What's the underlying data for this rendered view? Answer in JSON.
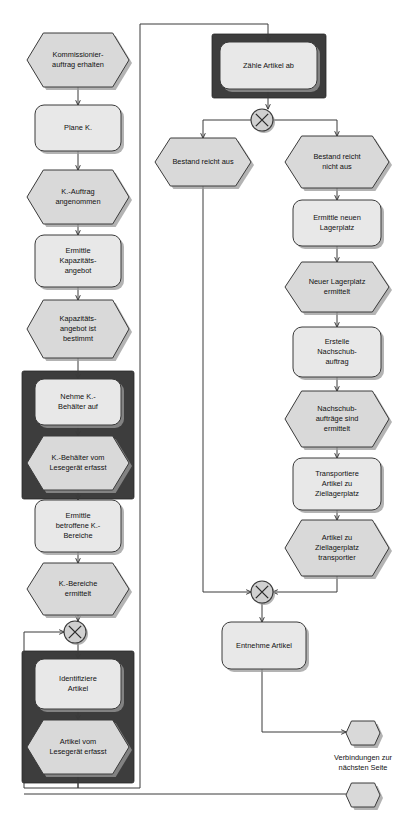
{
  "diagram": {
    "language": "de",
    "colors": {
      "shape_fill": "#d9d9d9",
      "shape_fill_light": "#e8e8e8",
      "shape_stroke": "#3a3a3a",
      "group_box": "#3d3d3d",
      "gateway_fill": "#d0d0d0",
      "connector": "#3a3a3a",
      "background": "#ffffff",
      "shadow": "#9a9a9a"
    },
    "nodes": [
      {
        "id": "n1",
        "label": "Kommissionier-\nauftrag erhalten",
        "type": "event",
        "x": 27,
        "y": 33,
        "w": 102,
        "h": 54
      },
      {
        "id": "n2",
        "label": "Plane K.",
        "type": "function",
        "x": 35,
        "y": 105,
        "w": 86,
        "h": 46
      },
      {
        "id": "n3",
        "label": "K.-Auftrag\nangenommen",
        "type": "event",
        "x": 27,
        "y": 170,
        "w": 102,
        "h": 54
      },
      {
        "id": "n4",
        "label": "Ermittle\nKapazitäts-\nangebot",
        "type": "function",
        "x": 35,
        "y": 235,
        "w": 86,
        "h": 52
      },
      {
        "id": "n5",
        "label": "Kapazitäts-\nangebot ist\nbestimmt",
        "type": "event",
        "x": 27,
        "y": 300,
        "w": 102,
        "h": 58
      },
      {
        "id": "n6",
        "label": "Nehme K.-\nBehälter auf",
        "type": "function",
        "x": 35,
        "y": 379,
        "w": 86,
        "h": 46
      },
      {
        "id": "n7",
        "label": "K.-Behälter vom\nLesegerät erfasst",
        "type": "event",
        "x": 27,
        "y": 436,
        "w": 102,
        "h": 54
      },
      {
        "id": "n8",
        "label": "Ermittle\nbetroffene K.-\nBereiche",
        "type": "function",
        "x": 35,
        "y": 500,
        "w": 86,
        "h": 52
      },
      {
        "id": "n9",
        "label": "K.-Bereiche\nermittelt",
        "type": "event",
        "x": 27,
        "y": 563,
        "w": 102,
        "h": 52
      },
      {
        "id": "n10",
        "label": "Identifiziere\nArtikel",
        "type": "function",
        "x": 35,
        "y": 659,
        "w": 86,
        "h": 50
      },
      {
        "id": "n11",
        "label": "Artikel vom\nLesegerät erfasst",
        "type": "event",
        "x": 27,
        "y": 720,
        "w": 102,
        "h": 54
      },
      {
        "id": "n12",
        "label": "Zähle Artikel ab",
        "type": "function",
        "x": 220,
        "y": 42,
        "w": 97,
        "h": 47
      },
      {
        "id": "n13",
        "label": "Bestand reicht aus",
        "type": "event",
        "x": 155,
        "y": 138,
        "w": 96,
        "h": 48
      },
      {
        "id": "n14",
        "label": "Bestand reicht\nnicht aus",
        "type": "event",
        "x": 285,
        "y": 136,
        "w": 104,
        "h": 52
      },
      {
        "id": "n15",
        "label": "Ermittle neuen\nLagerplatz",
        "type": "function",
        "x": 293,
        "y": 200,
        "w": 88,
        "h": 46
      },
      {
        "id": "n16",
        "label": "Neuer Lagerplatz\nermittelt",
        "type": "event",
        "x": 285,
        "y": 262,
        "w": 104,
        "h": 50
      },
      {
        "id": "n17",
        "label": "Erstelle\nNachschub-\nauftrag",
        "type": "function",
        "x": 293,
        "y": 327,
        "w": 88,
        "h": 50
      },
      {
        "id": "n18",
        "label": "Nachschub-\naufträge sind\nermittelt",
        "type": "event",
        "x": 285,
        "y": 391,
        "w": 104,
        "h": 56
      },
      {
        "id": "n19",
        "label": "Transportiere\nArtikel zu\nZiellagerplatz",
        "type": "function",
        "x": 293,
        "y": 458,
        "w": 88,
        "h": 52
      },
      {
        "id": "n20",
        "label": "Artikel zu\nZiellagerplatz\ntransportier",
        "type": "event",
        "x": 285,
        "y": 520,
        "w": 104,
        "h": 56
      },
      {
        "id": "n21",
        "label": "Entnehme Artikel",
        "type": "function",
        "x": 222,
        "y": 622,
        "w": 84,
        "h": 47
      }
    ],
    "gateways": [
      {
        "id": "g1",
        "label": "XOR",
        "cx": 262,
        "cy": 120,
        "r": 11,
        "role": "split-bestand"
      },
      {
        "id": "g2",
        "label": "XOR",
        "cx": 262,
        "cy": 592,
        "r": 11,
        "role": "join-entnahme"
      },
      {
        "id": "g3",
        "label": "XOR",
        "cx": 75,
        "cy": 632,
        "r": 11,
        "role": "join-artikelschleife"
      }
    ],
    "group_boxes": [
      {
        "id": "gb1",
        "x": 22,
        "y": 371,
        "w": 112,
        "h": 128,
        "label": "Erfassung K.-Behälter"
      },
      {
        "id": "gb2",
        "x": 22,
        "y": 651,
        "w": 112,
        "h": 132,
        "label": "Erfassung Artikel"
      },
      {
        "id": "gb3",
        "x": 212,
        "y": 34,
        "w": 114,
        "h": 64,
        "label": "Zählung Artikel"
      }
    ],
    "connectors": [
      {
        "id": "c1",
        "path": "M78,87 L78,105",
        "arrow": true
      },
      {
        "id": "c2",
        "path": "M78,151 L78,170",
        "arrow": true
      },
      {
        "id": "c3",
        "path": "M78,224 L78,235",
        "arrow": true
      },
      {
        "id": "c4",
        "path": "M78,287 L78,300",
        "arrow": true
      },
      {
        "id": "c5",
        "path": "M78,358 L78,379",
        "arrow": true
      },
      {
        "id": "c6",
        "path": "M78,425 L78,436",
        "arrow": true
      },
      {
        "id": "c7",
        "path": "M78,490 L78,500",
        "arrow": true
      },
      {
        "id": "c8",
        "path": "M78,552 L78,563",
        "arrow": true
      },
      {
        "id": "c9",
        "path": "M78,615 L78,621",
        "arrow": true
      },
      {
        "id": "c10",
        "path": "M78,643 L78,659",
        "arrow": true
      },
      {
        "id": "c11",
        "path": "M78,709 L78,720",
        "arrow": true
      },
      {
        "id": "c12",
        "path": "M78,774 L78,788 L140,788 L140,24 L268,24 L268,42",
        "arrow": true,
        "note": "Artikel erfasst -> Zähle Artikel ab"
      },
      {
        "id": "c13",
        "path": "M268,89 L268,109",
        "arrow": true
      },
      {
        "id": "c14",
        "path": "M251,120 L203,120 L203,138",
        "arrow": true
      },
      {
        "id": "c15",
        "path": "M273,120 L337,120 L337,136",
        "arrow": true
      },
      {
        "id": "c16",
        "path": "M337,188 L337,200",
        "arrow": true
      },
      {
        "id": "c17",
        "path": "M337,246 L337,262",
        "arrow": true
      },
      {
        "id": "c18",
        "path": "M337,312 L337,327",
        "arrow": true
      },
      {
        "id": "c19",
        "path": "M337,377 L337,391",
        "arrow": true
      },
      {
        "id": "c20",
        "path": "M337,447 L337,458",
        "arrow": true
      },
      {
        "id": "c21",
        "path": "M337,510 L337,520",
        "arrow": true
      },
      {
        "id": "c22",
        "path": "M337,576 L337,592 L273,592",
        "arrow": true
      },
      {
        "id": "c23",
        "path": "M203,186 L203,592 L251,592",
        "arrow": true
      },
      {
        "id": "c24",
        "path": "M262,603 L262,622",
        "arrow": true
      },
      {
        "id": "c25",
        "path": "M262,669 L262,732 L346,732",
        "arrow": true,
        "note": "Entnehme Artikel -> Seitenkonnektor oben"
      },
      {
        "id": "c26",
        "path": "M78,774 L78,788 L24,788 L24,632 L64,632",
        "arrow": true,
        "note": "Rücksprung zur Artikelschleife"
      },
      {
        "id": "c27",
        "path": "M346,794 L24,794",
        "arrow": false,
        "note": "Seitenkonnektor unten"
      }
    ],
    "offpage_connectors": [
      {
        "id": "op1",
        "x": 346,
        "y": 721,
        "w": 34,
        "h": 24
      },
      {
        "id": "op2",
        "x": 346,
        "y": 783,
        "w": 34,
        "h": 24
      }
    ],
    "captions": [
      {
        "id": "cap1",
        "text": "Verbindungen zur\nnächsten Seite",
        "x": 363,
        "y": 760
      }
    ]
  }
}
